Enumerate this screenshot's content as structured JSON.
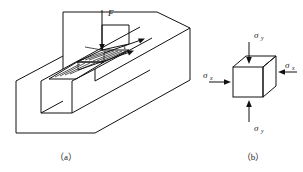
{
  "figure": {
    "background": "#ffffff",
    "line_color": "#111111",
    "panels": [
      {
        "id": "panel-a",
        "caption": "（a）",
        "description": "Grooved block under punching force showing shear plane",
        "labels": {
          "force": "F",
          "shear_stress": "τ"
        }
      },
      {
        "id": "panel-b",
        "caption": "（b）",
        "description": "Stress element cube with normal stresses",
        "labels": {
          "sigma_top": "σ",
          "sigma_top_sub": "y",
          "sigma_bottom": "σ",
          "sigma_bottom_sub": "y",
          "sigma_left": "σ",
          "sigma_left_sub": "x",
          "sigma_right": "σ",
          "sigma_right_sub": "x"
        }
      }
    ]
  }
}
